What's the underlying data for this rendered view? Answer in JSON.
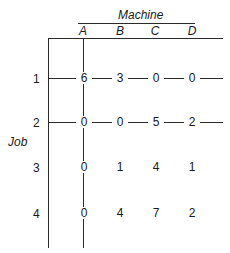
{
  "figure": {
    "column_group_label": "Machine",
    "row_group_label": "Job",
    "columns": [
      "A",
      "B",
      "C",
      "D"
    ],
    "rows": [
      "1",
      "2",
      "3",
      "4"
    ],
    "matrix": [
      [
        "6",
        "3",
        "0",
        "0"
      ],
      [
        "0",
        "0",
        "5",
        "2"
      ],
      [
        "0",
        "1",
        "4",
        "1"
      ],
      [
        "0",
        "4",
        "7",
        "2"
      ]
    ],
    "covering_lines": {
      "horizontal_rows": [
        "1",
        "2"
      ],
      "vertical_columns": [
        "A"
      ]
    }
  }
}
